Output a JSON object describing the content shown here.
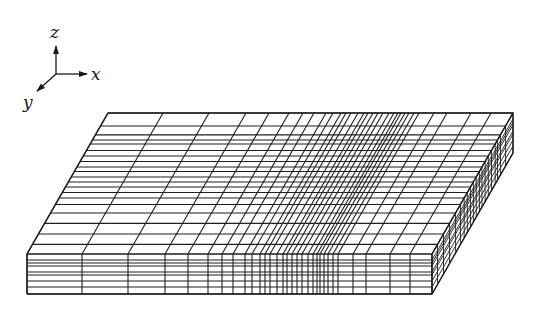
{
  "figure": {
    "background": "#ffffff",
    "line_color": "#1f1f1f"
  },
  "axes_triad": {
    "origin": [
      56,
      74
    ],
    "x": {
      "label": "x",
      "tip": [
        87,
        74
      ],
      "label_pos": [
        91,
        80
      ]
    },
    "y": {
      "label": "y",
      "tip": [
        37,
        91
      ],
      "label_pos": [
        23,
        108
      ]
    },
    "z": {
      "label": "z",
      "tip": [
        56,
        46
      ],
      "label_pos": [
        50,
        38
      ]
    }
  },
  "mesh": {
    "front_left_top": [
      27,
      254
    ],
    "front_bottom_y": 294,
    "depth_offset": [
      81,
      -141
    ],
    "front_x_lines": [
      27,
      82,
      128,
      165,
      188,
      208,
      222,
      233,
      245,
      252,
      260,
      265,
      270,
      277,
      283,
      287,
      292,
      297,
      302,
      308,
      313,
      317,
      320,
      324,
      328,
      333,
      338,
      353,
      366,
      390,
      410,
      432
    ],
    "front_z_lines": [
      254,
      260,
      263,
      266,
      272,
      275,
      281,
      287,
      294
    ],
    "depth_fractions": [
      0,
      0.068,
      0.142,
      0.217,
      0.291,
      0.351,
      0.397,
      0.436,
      0.475,
      0.511,
      0.546,
      0.585,
      0.617,
      0.656,
      0.695,
      0.734,
      0.78,
      0.809,
      0.845,
      0.908,
      1.0
    ]
  }
}
